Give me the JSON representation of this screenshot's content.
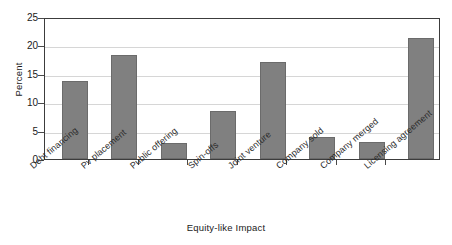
{
  "chart_data": {
    "type": "bar",
    "title": "",
    "xlabel": "Equity-like Impact",
    "ylabel": "Percent",
    "ylim": [
      0,
      25
    ],
    "yticks": [
      0,
      5,
      10,
      15,
      20,
      25
    ],
    "grid": true,
    "legend": "none",
    "categories": [
      "Debt financing",
      "Pv placement",
      "Public offering",
      "Spin-offs",
      "Joint venture",
      "Company sold",
      "Company merged",
      "Licensing agreement"
    ],
    "values": [
      13.9,
      18.5,
      2.8,
      8.5,
      17.4,
      3.9,
      3.1,
      21.6
    ],
    "bar_color": "#808080",
    "bar_edge_color": "#6b6b6b",
    "axis_color": "#3c3c3c",
    "grid_color": "#d6d6d6"
  }
}
